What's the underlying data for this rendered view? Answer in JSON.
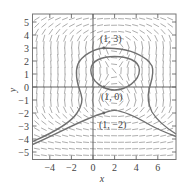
{
  "figure": {
    "type": "slope-field",
    "xlabel": "x",
    "ylabel": "y",
    "xlim": [
      -5.6,
      7.7
    ],
    "ylim": [
      -5.6,
      5.6
    ],
    "x_ticks": [
      "−4",
      "−2",
      "0",
      "2",
      "4",
      "6"
    ],
    "x_tick_values": [
      -4,
      -2,
      0,
      2,
      4,
      6
    ],
    "y_ticks": [
      "5",
      "4",
      "3",
      "2",
      "1",
      "0",
      "−1",
      "−2",
      "−3",
      "−4",
      "−5"
    ],
    "y_tick_values": [
      5,
      4,
      3,
      2,
      1,
      0,
      -1,
      -2,
      -3,
      -4,
      -5
    ],
    "point_labels": [
      {
        "text": "(1, 3)",
        "x": 1,
        "y": 3
      },
      {
        "text": "(1, 0)",
        "x": 1,
        "y": 0
      },
      {
        "text": "(1, −2)",
        "x": 1,
        "y": -2
      }
    ],
    "solution_curves": [
      {
        "name": "through (1, 3)",
        "passes_through": [
          1,
          3
        ],
        "shape": "outer pinched loop opening downward"
      },
      {
        "name": "through (1, 0)",
        "passes_through": [
          1,
          0
        ],
        "shape": "closed loop centered near (2, 1.2)"
      },
      {
        "name": "through (1, −2)",
        "passes_through": [
          1,
          -2
        ],
        "shape": "arch peaking near (2, −1.8)"
      }
    ],
    "colors": {
      "curve": "#707070",
      "field": "#8a8a8a",
      "axes": "#555555",
      "frame": "#777777"
    }
  }
}
